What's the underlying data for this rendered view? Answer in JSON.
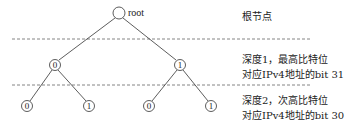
{
  "diagram": {
    "type": "binary-trie",
    "root": {
      "label": "root"
    },
    "levels": [
      {
        "depth": 0,
        "description": [
          "根节点"
        ]
      },
      {
        "depth": 1,
        "nodes": [
          "0",
          "1"
        ],
        "description": [
          "深度1，最高比特位",
          "对应IPv4地址的bit 31"
        ]
      },
      {
        "depth": 2,
        "nodes": [
          "0",
          "1",
          "0",
          "1"
        ],
        "description": [
          "深度2，次高比特位",
          "对应IPv4地址的bit 30"
        ]
      }
    ],
    "colors": {
      "line": "#333333",
      "dash": "#666666",
      "background": "#ffffff"
    }
  }
}
